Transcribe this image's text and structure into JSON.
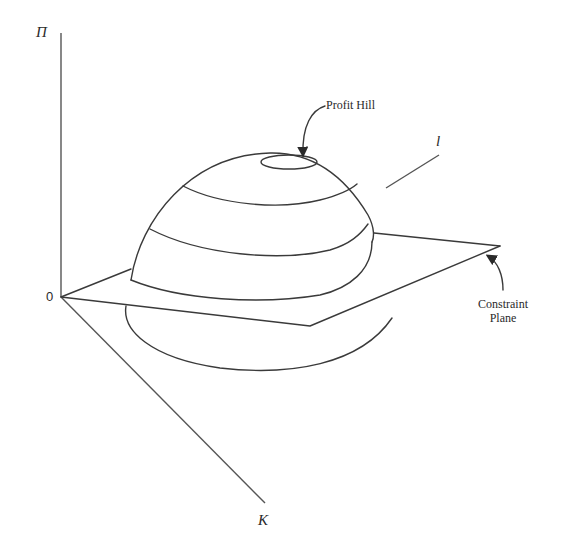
{
  "diagram": {
    "axes": {
      "vertical": {
        "label": "Π"
      },
      "depth": {
        "label": "K"
      },
      "horizontal": {
        "label": "l"
      },
      "origin": {
        "label": "0"
      }
    },
    "annotations": {
      "profit_hill": "Profit Hill",
      "constraint_plane_line1": "Constraint",
      "constraint_plane_line2": "Plane"
    },
    "colors": {
      "line": "#3a3a3a",
      "background": "#ffffff"
    }
  }
}
